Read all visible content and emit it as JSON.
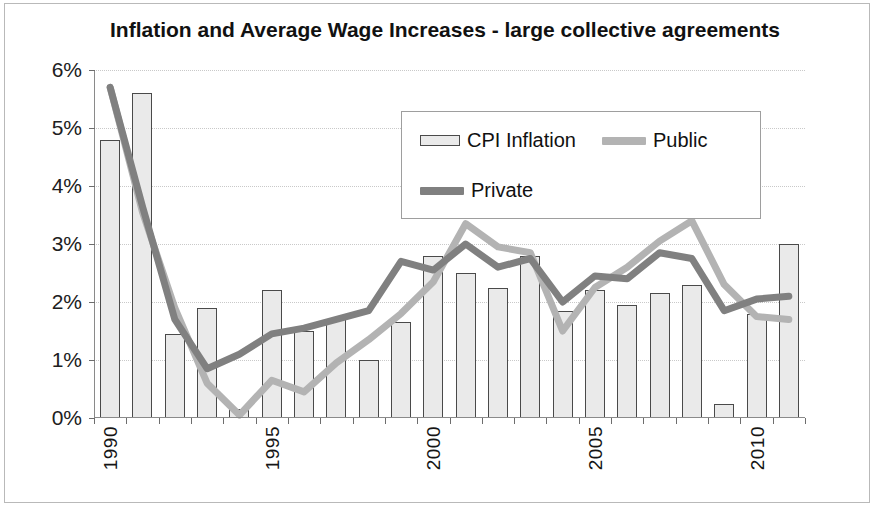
{
  "chart_data": {
    "type": "bar",
    "title": "Inflation and Average Wage Increases - large collective agreements",
    "xlabel": "",
    "ylabel": "",
    "ylim": [
      0,
      6
    ],
    "ytick_labels": [
      "0%",
      "1%",
      "2%",
      "3%",
      "4%",
      "5%",
      "6%"
    ],
    "ytick_values": [
      0,
      1,
      2,
      3,
      4,
      5,
      6
    ],
    "grid": true,
    "legend_position": "upper-center",
    "x": [
      1990,
      1991,
      1992,
      1993,
      1994,
      1995,
      1996,
      1997,
      1998,
      1999,
      2000,
      2001,
      2002,
      2003,
      2004,
      2005,
      2006,
      2007,
      2008,
      2009,
      2010,
      2011
    ],
    "xtick_labels": [
      "1990",
      "1995",
      "2000",
      "2005",
      "2010"
    ],
    "xtick_values": [
      1990,
      1995,
      2000,
      2005,
      2010
    ],
    "series": [
      {
        "name": "CPI Inflation",
        "type": "bar",
        "color": "#eaeaea",
        "edge_color": "#4a4a4a",
        "values": [
          4.8,
          5.6,
          1.45,
          1.9,
          0.15,
          2.2,
          1.5,
          1.7,
          1.0,
          1.65,
          2.8,
          2.5,
          2.25,
          2.8,
          1.85,
          2.2,
          1.95,
          2.15,
          2.3,
          0.25,
          1.8,
          3.0
        ]
      },
      {
        "name": "Public",
        "type": "line",
        "color": "#b3b3b3",
        "values": [
          5.7,
          3.55,
          1.9,
          0.6,
          0.05,
          0.65,
          0.45,
          0.95,
          1.35,
          1.8,
          2.35,
          3.35,
          2.95,
          2.85,
          1.5,
          2.25,
          2.6,
          3.05,
          3.4,
          2.3,
          1.75,
          1.7
        ]
      },
      {
        "name": "Private",
        "type": "line",
        "color": "#808080",
        "values": [
          5.7,
          3.65,
          1.7,
          0.85,
          1.1,
          1.45,
          1.55,
          1.7,
          1.85,
          2.7,
          2.55,
          3.0,
          2.6,
          2.75,
          2.0,
          2.45,
          2.4,
          2.85,
          2.75,
          1.85,
          2.05,
          2.1
        ]
      }
    ]
  },
  "legend": {
    "entries": [
      {
        "label": "CPI Inflation",
        "marker": "bar-swatch"
      },
      {
        "label": "Public",
        "marker": "line-swatch"
      },
      {
        "label": "Private",
        "marker": "line-swatch"
      }
    ]
  }
}
